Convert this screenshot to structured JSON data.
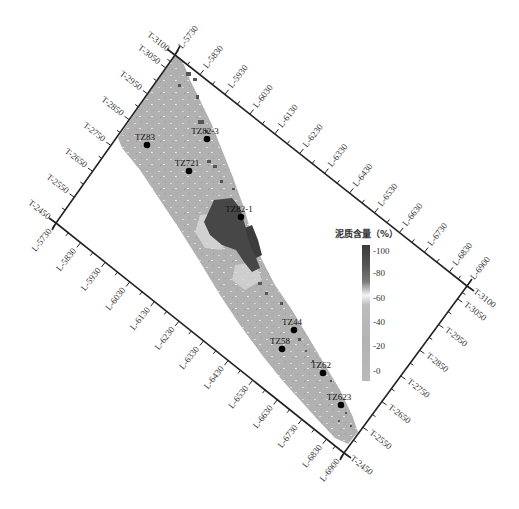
{
  "figure": {
    "type": "seismic attribute map",
    "frame_corners_px": {
      "top": [
        175,
        55
      ],
      "right": [
        467,
        286
      ],
      "bottom": [
        344,
        453
      ],
      "left": [
        56,
        223
      ]
    }
  },
  "axes": {
    "top_edge_L": [
      "L-5730",
      "L-5830",
      "L-5930",
      "L-6030",
      "L-6130",
      "L-6230",
      "L-6330",
      "L-6430",
      "L-6530",
      "L-6630",
      "L-6730",
      "L-6830",
      "L-6900"
    ],
    "bottom_edge_L": [
      "L-5730",
      "L-5830",
      "L-5930",
      "L-6030",
      "L-6130",
      "L-6230",
      "L-6330",
      "L-6430",
      "L-6530",
      "L-6630",
      "L-6730",
      "L-6830",
      "L-6900"
    ],
    "left_edge_T": [
      "T-3100",
      "T-3050",
      "T-2950",
      "T-2850",
      "T-2750",
      "T-2650",
      "T-2550",
      "T-2450"
    ],
    "right_edge_T": [
      "T-3100",
      "T-3050",
      "T-2950",
      "T-2850",
      "T-2750",
      "T-2650",
      "T-2550",
      "T-2450"
    ]
  },
  "wells": [
    {
      "name": "TZ83",
      "x": 147,
      "y": 145
    },
    {
      "name": "TZ82-3",
      "x": 207,
      "y": 139
    },
    {
      "name": "TZ721",
      "x": 189,
      "y": 171
    },
    {
      "name": "TZ82-1",
      "x": 241,
      "y": 217
    },
    {
      "name": "TZ44",
      "x": 294,
      "y": 330
    },
    {
      "name": "TZ58",
      "x": 282,
      "y": 349
    },
    {
      "name": "TZ62",
      "x": 323,
      "y": 373
    },
    {
      "name": "TZ623",
      "x": 341,
      "y": 405
    }
  ],
  "legend": {
    "title": "泥质含量（%）",
    "ticks": [
      "-100",
      "-80",
      "-60",
      "-40",
      "-20",
      "-0"
    ],
    "colors": {
      "high": "#3a3a3a",
      "mid": "#f4f4f4",
      "low": "#b5b5b5"
    }
  },
  "chart_data": {
    "type": "heatmap",
    "title": "泥质含量（%）",
    "colorbar_range": [
      0,
      100
    ],
    "colorbar_ticks": [
      0,
      20,
      40,
      60,
      80,
      100
    ],
    "x_axis_labels": [
      "L-5730",
      "L-5830",
      "L-5930",
      "L-6030",
      "L-6130",
      "L-6230",
      "L-6330",
      "L-6430",
      "L-6530",
      "L-6630",
      "L-6730",
      "L-6830",
      "L-6900"
    ],
    "y_axis_labels": [
      "T-2450",
      "T-2550",
      "T-2650",
      "T-2750",
      "T-2850",
      "T-2950",
      "T-3050",
      "T-3100"
    ],
    "wells": [
      "TZ83",
      "TZ82-3",
      "TZ721",
      "TZ82-1",
      "TZ44",
      "TZ58",
      "TZ62",
      "TZ623"
    ],
    "annotations": "High mud content (dark, >80%) concentrated around TZ82-1 and along the NE margin; most of area ~20-40% (medium grey)."
  }
}
